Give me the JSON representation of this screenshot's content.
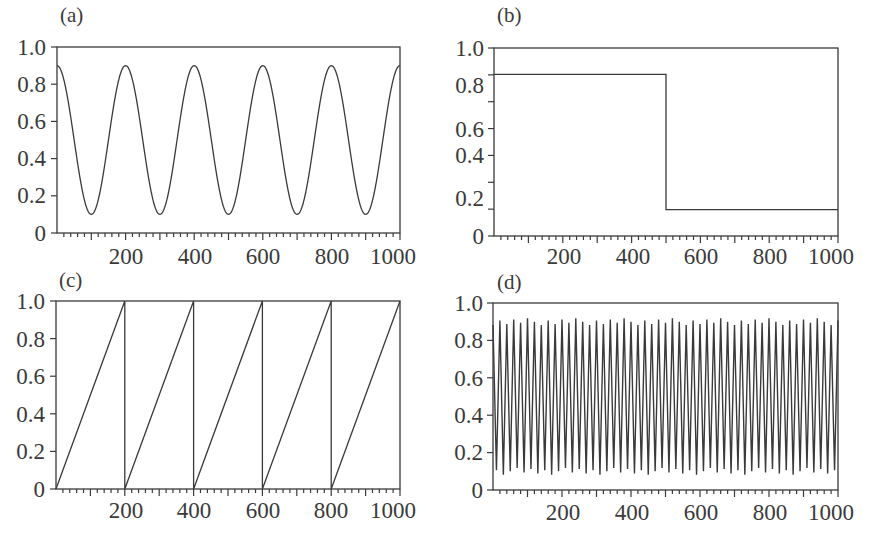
{
  "chart_data": [
    {
      "panel": "(a)",
      "type": "line",
      "title": "",
      "xlabel": "",
      "ylabel": "",
      "xlim": [
        0,
        1000
      ],
      "ylim": [
        0,
        1.0
      ],
      "yticks": [
        "0",
        "0.2",
        "0.4",
        "0.6",
        "0.8",
        "1.0"
      ],
      "xticks": [
        "200",
        "400",
        "600",
        "800",
        "1000"
      ],
      "grid": false,
      "description": "Cosine wave 0.5 + 0.4*cos(2*pi*x/200), period 200",
      "x": [
        0,
        100,
        200,
        300,
        400,
        500,
        600,
        700,
        800,
        900,
        1000
      ],
      "y": [
        0.9,
        0.1,
        0.9,
        0.1,
        0.9,
        0.1,
        0.9,
        0.1,
        0.9,
        0.1,
        0.9
      ]
    },
    {
      "panel": "(b)",
      "type": "line",
      "title": "",
      "xlabel": "",
      "ylabel": "",
      "xlim": [
        0,
        1000
      ],
      "ylim": [
        0,
        1.0
      ],
      "yticks": [
        "0",
        "0.2",
        "0.4",
        "0.6",
        "0.8",
        "1.0"
      ],
      "xticks": [
        "200",
        "400",
        "600",
        "800",
        "1000"
      ],
      "grid": false,
      "description": "Step function: high until x=500, then low",
      "x": [
        0,
        500,
        500,
        1000
      ],
      "y": [
        0.86,
        0.86,
        0.14,
        0.14
      ]
    },
    {
      "panel": "(c)",
      "type": "line",
      "title": "",
      "xlabel": "",
      "ylabel": "",
      "xlim": [
        0,
        1000
      ],
      "ylim": [
        0,
        1.0
      ],
      "yticks": [
        "0",
        "0.2",
        "0.4",
        "0.6",
        "0.8",
        "1.0"
      ],
      "xticks": [
        "200",
        "400",
        "600",
        "800",
        "1000"
      ],
      "grid": false,
      "description": "Sawtooth wave rising 0 to 1 over period 200",
      "x": [
        0,
        200,
        200,
        400,
        400,
        600,
        600,
        800,
        800,
        1000
      ],
      "y": [
        0,
        1,
        0,
        1,
        0,
        1,
        0,
        1,
        0,
        1
      ]
    },
    {
      "panel": "(d)",
      "type": "line",
      "title": "",
      "xlabel": "",
      "ylabel": "",
      "xlim": [
        0,
        1000
      ],
      "ylim": [
        0,
        1.0
      ],
      "yticks": [
        "0",
        "0.2",
        "0.4",
        "0.6",
        "0.8",
        "1.0"
      ],
      "xticks": [
        "200",
        "400",
        "600",
        "800",
        "1000"
      ],
      "grid": false,
      "description": "High-frequency oscillation between ~0.1 and ~0.9, period ~20 (about 50 cycles)",
      "period": 20,
      "amplitude_range": [
        0.1,
        0.9
      ]
    }
  ],
  "panels": [
    {
      "label": "(a)",
      "yticks": [
        "1.0",
        "0.8",
        "0.6",
        "0.4",
        "0.2",
        "0"
      ],
      "xticks": [
        "200",
        "400",
        "600",
        "800",
        "1000"
      ]
    },
    {
      "label": "(b)",
      "yticks": [
        "1.0",
        "0.8",
        "0.6",
        "0.4",
        "0.2",
        "0"
      ],
      "xticks": [
        "200",
        "400",
        "600",
        "800",
        "1000"
      ]
    },
    {
      "label": "(c)",
      "yticks": [
        "1.0",
        "0.8",
        "0.6",
        "0.4",
        "0.2",
        "0"
      ],
      "xticks": [
        "200",
        "400",
        "600",
        "800",
        "1000"
      ]
    },
    {
      "label": "(d)",
      "yticks": [
        "1.0",
        "0.8",
        "0.6",
        "0.4",
        "0.2",
        "0"
      ],
      "xticks": [
        "200",
        "400",
        "600",
        "800",
        "1000"
      ]
    }
  ]
}
